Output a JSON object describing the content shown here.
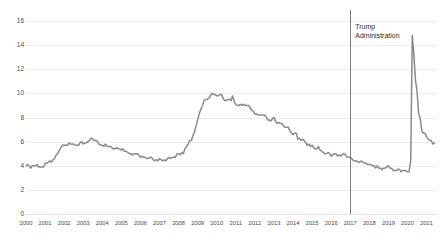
{
  "chart_data": {
    "type": "line",
    "title": "",
    "subtitle": "",
    "xlabel": "",
    "ylabel": "",
    "xlim": [
      2000,
      2021.6
    ],
    "ylim": [
      0,
      16
    ],
    "grid": true,
    "legend": "none",
    "line_color": "#8a8a8a",
    "x_ticks": [
      "2000",
      "2001",
      "2002",
      "2003",
      "2004",
      "2005",
      "2006",
      "2007",
      "2008",
      "2009",
      "2010",
      "2011",
      "2012",
      "2013",
      "2014",
      "2015",
      "2016",
      "2017",
      "2018",
      "2019",
      "2020",
      "2021"
    ],
    "y_ticks": [
      "0",
      "2",
      "4",
      "6",
      "8",
      "10",
      "12",
      "14",
      "16"
    ],
    "annotations": [
      {
        "name": "trump-administration",
        "label": "Trump\nAdministration",
        "x": 2017.0,
        "line_color": "#7b7b7b",
        "label_x": 2017.15,
        "label_y": 15.6
      }
    ],
    "series": [
      {
        "name": "Unemployment rate",
        "color": "#8a8a8a",
        "x": [
          2000.0,
          2000.08,
          2000.17,
          2000.25,
          2000.33,
          2000.42,
          2000.5,
          2000.58,
          2000.67,
          2000.75,
          2000.83,
          2000.92,
          2001.0,
          2001.08,
          2001.17,
          2001.25,
          2001.33,
          2001.42,
          2001.5,
          2001.58,
          2001.67,
          2001.75,
          2001.83,
          2001.92,
          2002.0,
          2002.08,
          2002.17,
          2002.25,
          2002.33,
          2002.42,
          2002.5,
          2002.58,
          2002.67,
          2002.75,
          2002.83,
          2002.92,
          2003.0,
          2003.08,
          2003.17,
          2003.25,
          2003.33,
          2003.42,
          2003.5,
          2003.58,
          2003.67,
          2003.75,
          2003.83,
          2003.92,
          2004.0,
          2004.08,
          2004.17,
          2004.25,
          2004.33,
          2004.42,
          2004.5,
          2004.58,
          2004.67,
          2004.75,
          2004.83,
          2004.92,
          2005.0,
          2005.08,
          2005.17,
          2005.25,
          2005.33,
          2005.42,
          2005.5,
          2005.58,
          2005.67,
          2005.75,
          2005.83,
          2005.92,
          2006.0,
          2006.08,
          2006.17,
          2006.25,
          2006.33,
          2006.42,
          2006.5,
          2006.58,
          2006.67,
          2006.75,
          2006.83,
          2006.92,
          2007.0,
          2007.08,
          2007.17,
          2007.25,
          2007.33,
          2007.42,
          2007.5,
          2007.58,
          2007.67,
          2007.75,
          2007.83,
          2007.92,
          2008.0,
          2008.08,
          2008.17,
          2008.25,
          2008.33,
          2008.42,
          2008.5,
          2008.58,
          2008.67,
          2008.75,
          2008.83,
          2008.92,
          2009.0,
          2009.08,
          2009.17,
          2009.25,
          2009.33,
          2009.42,
          2009.5,
          2009.58,
          2009.67,
          2009.75,
          2009.83,
          2009.92,
          2010.0,
          2010.08,
          2010.17,
          2010.25,
          2010.33,
          2010.42,
          2010.5,
          2010.58,
          2010.67,
          2010.75,
          2010.83,
          2010.92,
          2011.0,
          2011.08,
          2011.17,
          2011.25,
          2011.33,
          2011.42,
          2011.5,
          2011.58,
          2011.67,
          2011.75,
          2011.83,
          2011.92,
          2012.0,
          2012.08,
          2012.17,
          2012.25,
          2012.33,
          2012.42,
          2012.5,
          2012.58,
          2012.67,
          2012.75,
          2012.83,
          2012.92,
          2013.0,
          2013.08,
          2013.17,
          2013.25,
          2013.33,
          2013.42,
          2013.5,
          2013.58,
          2013.67,
          2013.75,
          2013.83,
          2013.92,
          2014.0,
          2014.08,
          2014.17,
          2014.25,
          2014.33,
          2014.42,
          2014.5,
          2014.58,
          2014.67,
          2014.75,
          2014.83,
          2014.92,
          2015.0,
          2015.08,
          2015.17,
          2015.25,
          2015.33,
          2015.42,
          2015.5,
          2015.58,
          2015.67,
          2015.75,
          2015.83,
          2015.92,
          2016.0,
          2016.08,
          2016.17,
          2016.25,
          2016.33,
          2016.42,
          2016.5,
          2016.58,
          2016.67,
          2016.75,
          2016.83,
          2016.92,
          2017.0,
          2017.08,
          2017.17,
          2017.25,
          2017.33,
          2017.42,
          2017.5,
          2017.58,
          2017.67,
          2017.75,
          2017.83,
          2017.92,
          2018.0,
          2018.08,
          2018.17,
          2018.25,
          2018.33,
          2018.42,
          2018.5,
          2018.58,
          2018.67,
          2018.75,
          2018.83,
          2018.92,
          2019.0,
          2019.08,
          2019.17,
          2019.25,
          2019.33,
          2019.42,
          2019.5,
          2019.58,
          2019.67,
          2019.75,
          2019.83,
          2019.92,
          2020.0,
          2020.08,
          2020.17,
          2020.25,
          2020.33,
          2020.42,
          2020.5,
          2020.58,
          2020.67,
          2020.75,
          2020.83,
          2020.92,
          2021.0,
          2021.08,
          2021.17,
          2021.25,
          2021.33,
          2021.42
        ],
        "values": [
          4.0,
          4.1,
          4.0,
          3.8,
          4.0,
          4.0,
          4.0,
          4.1,
          3.9,
          3.9,
          3.9,
          3.9,
          4.2,
          4.2,
          4.3,
          4.4,
          4.3,
          4.5,
          4.6,
          4.9,
          5.0,
          5.3,
          5.5,
          5.7,
          5.7,
          5.7,
          5.7,
          5.9,
          5.8,
          5.8,
          5.8,
          5.7,
          5.7,
          5.7,
          5.9,
          6.0,
          5.8,
          5.9,
          5.9,
          6.0,
          6.1,
          6.3,
          6.2,
          6.1,
          6.1,
          6.0,
          5.8,
          5.7,
          5.7,
          5.6,
          5.8,
          5.6,
          5.6,
          5.6,
          5.5,
          5.4,
          5.4,
          5.5,
          5.4,
          5.4,
          5.3,
          5.4,
          5.2,
          5.2,
          5.1,
          5.0,
          5.0,
          4.9,
          5.0,
          5.0,
          5.0,
          4.9,
          4.7,
          4.8,
          4.7,
          4.7,
          4.6,
          4.6,
          4.7,
          4.7,
          4.5,
          4.4,
          4.5,
          4.4,
          4.6,
          4.5,
          4.4,
          4.5,
          4.4,
          4.6,
          4.7,
          4.6,
          4.7,
          4.7,
          4.7,
          5.0,
          5.0,
          4.9,
          5.1,
          5.0,
          5.4,
          5.6,
          5.8,
          6.1,
          6.1,
          6.5,
          6.8,
          7.3,
          7.8,
          8.3,
          8.7,
          9.0,
          9.4,
          9.5,
          9.5,
          9.6,
          9.8,
          10.0,
          9.9,
          9.9,
          9.8,
          9.8,
          9.9,
          9.9,
          9.6,
          9.4,
          9.4,
          9.5,
          9.5,
          9.4,
          9.8,
          9.3,
          9.1,
          9.0,
          9.0,
          9.1,
          9.0,
          9.1,
          9.0,
          9.0,
          9.0,
          8.8,
          8.6,
          8.5,
          8.3,
          8.3,
          8.2,
          8.2,
          8.2,
          8.2,
          8.2,
          8.1,
          7.8,
          7.8,
          7.7,
          7.9,
          8.0,
          7.7,
          7.5,
          7.6,
          7.5,
          7.5,
          7.3,
          7.2,
          7.2,
          7.2,
          6.9,
          6.7,
          6.6,
          6.7,
          6.7,
          6.2,
          6.3,
          6.1,
          6.2,
          6.1,
          5.9,
          5.7,
          5.8,
          5.6,
          5.7,
          5.5,
          5.4,
          5.4,
          5.6,
          5.3,
          5.2,
          5.1,
          5.0,
          5.0,
          5.1,
          5.0,
          4.8,
          4.9,
          5.0,
          5.0,
          4.8,
          4.9,
          4.8,
          4.9,
          5.0,
          4.9,
          4.7,
          4.7,
          4.7,
          4.6,
          4.4,
          4.4,
          4.4,
          4.3,
          4.3,
          4.4,
          4.3,
          4.2,
          4.2,
          4.1,
          4.1,
          4.1,
          4.0,
          4.0,
          3.8,
          4.0,
          3.8,
          3.8,
          3.7,
          3.8,
          3.8,
          3.9,
          4.0,
          3.8,
          3.8,
          3.6,
          3.6,
          3.6,
          3.7,
          3.7,
          3.5,
          3.6,
          3.6,
          3.6,
          3.5,
          3.5,
          4.4,
          14.8,
          13.3,
          11.1,
          10.2,
          8.4,
          7.9,
          6.9,
          6.7,
          6.7,
          6.4,
          6.2,
          6.1,
          6.1,
          5.8,
          5.9
        ]
      }
    ]
  }
}
